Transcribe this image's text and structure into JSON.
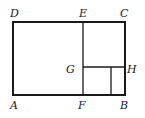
{
  "diagram": {
    "type": "geometry-figure",
    "stroke_color": "#1a1a1a",
    "background": "#ffffff",
    "points": {
      "A": {
        "label": "A",
        "x": 13,
        "y": 95
      },
      "B": {
        "label": "B",
        "x": 125,
        "y": 95
      },
      "C": {
        "label": "C",
        "x": 125,
        "y": 22
      },
      "D": {
        "label": "D",
        "x": 13,
        "y": 22
      },
      "E": {
        "label": "E",
        "x": 83,
        "y": 22
      },
      "F": {
        "label": "F",
        "x": 83,
        "y": 95
      },
      "G": {
        "label": "G",
        "x": 83,
        "y": 67
      },
      "H": {
        "label": "H",
        "x": 125,
        "y": 67
      }
    },
    "labels": {
      "A": "A",
      "B": "B",
      "C": "C",
      "D": "D",
      "E": "E",
      "F": "F",
      "G": "G",
      "H": "H"
    },
    "segments": [
      {
        "from": "A",
        "to": "B"
      },
      {
        "from": "B",
        "to": "C"
      },
      {
        "from": "C",
        "to": "D"
      },
      {
        "from": "D",
        "to": "A"
      },
      {
        "from": "E",
        "to": "F"
      },
      {
        "from": "G",
        "to": "H"
      },
      {
        "from": "inner-top",
        "to": "inner-bottom",
        "x": 111
      }
    ]
  }
}
